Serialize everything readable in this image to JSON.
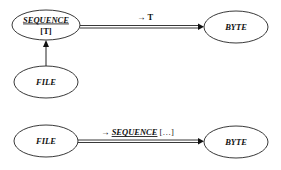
{
  "diagram": {
    "nodes": {
      "sequence": {
        "label": "SEQUENCE",
        "sublabel": "[T]"
      },
      "byte_top": {
        "label": "BYTE"
      },
      "file_top": {
        "label": "FILE"
      },
      "file_bottom": {
        "label": "FILE"
      },
      "byte_bottom": {
        "label": "BYTE"
      }
    },
    "edges": {
      "sequence_to_byte": {
        "arrow": "→",
        "label": "T"
      },
      "file_to_sequence": {
        "label": ""
      },
      "file_to_byte": {
        "arrow": "→",
        "label": "SEQUENCE",
        "suffix": "[…]"
      }
    }
  }
}
